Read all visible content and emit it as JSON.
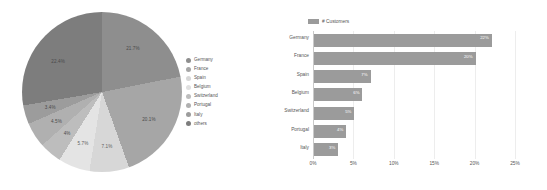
{
  "chart_data": [
    {
      "type": "pie",
      "title": "",
      "legend_position": "right",
      "categories": [
        "Germany",
        "France",
        "Spain",
        "Belgium",
        "Switzerland",
        "Portugal",
        "Italy",
        "others"
      ],
      "values": [
        21.7,
        20.1,
        7.1,
        5.7,
        4.0,
        4.5,
        3.4,
        22.4
      ],
      "labels": [
        "21.7%",
        "20.1%",
        "7.1%",
        "5.7%",
        "4%",
        "4.5%",
        "3.4%",
        "22.4%"
      ],
      "colors": [
        "#8e8e8e",
        "#a6a6a6",
        "#d7d7d7",
        "#e4e4e4",
        "#bdbdbd",
        "#b0b0b0",
        "#9c9c9c",
        "#7d7d7d"
      ]
    },
    {
      "type": "bar",
      "orientation": "horizontal",
      "title": "",
      "legend": [
        "# Customers"
      ],
      "legend_position": "top-left",
      "categories": [
        "Germany",
        "France",
        "Spain",
        "Belgium",
        "Switzerland",
        "Portugal",
        "Italy"
      ],
      "values": [
        22,
        20,
        7,
        6,
        5,
        4,
        3
      ],
      "value_labels": [
        "22%",
        "20%",
        "7%",
        "6%",
        "5%",
        "4%",
        "3%"
      ],
      "xlabel": "",
      "ylabel": "",
      "xlim": [
        0,
        25
      ],
      "xticks": [
        "0%",
        "5%",
        "10%",
        "15%",
        "20%",
        "25%"
      ],
      "xtick_values": [
        0,
        5,
        10,
        15,
        20,
        25
      ],
      "grid": false,
      "bar_color": "#9b9b9b"
    }
  ],
  "pie_legend": [
    {
      "label": "Germany",
      "color": "#8e8e8e"
    },
    {
      "label": "France",
      "color": "#a6a6a6"
    },
    {
      "label": "Spain",
      "color": "#d7d7d7"
    },
    {
      "label": "Belgium",
      "color": "#e0e0e0"
    },
    {
      "label": "Switzerland",
      "color": "#bdbdbd"
    },
    {
      "label": "Portugal",
      "color": "#b0b0b0"
    },
    {
      "label": "Italy",
      "color": "#9c9c9c"
    },
    {
      "label": "others",
      "color": "#7d7d7d"
    }
  ],
  "bar_legend": {
    "label": "# Customers",
    "color": "#9b9b9b"
  }
}
